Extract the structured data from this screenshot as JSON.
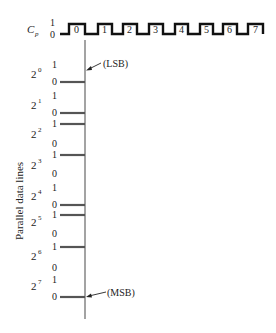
{
  "diagram": {
    "type": "timing-diagram",
    "clock": {
      "label": "C",
      "label_subscript": "p",
      "level_high": "1",
      "level_low": "0",
      "pulse_labels": [
        "0",
        "1",
        "2",
        "3",
        "4",
        "5",
        "6",
        "7"
      ],
      "pulse_rise_x": [
        69,
        98,
        123,
        149,
        175,
        200,
        223,
        248
      ],
      "pulse_fall_x": [
        85,
        112,
        137,
        163,
        188,
        213,
        237,
        263
      ],
      "color": "#111111"
    },
    "axis_label": "Parallel data lines",
    "lsb_label": "(LSB)",
    "msb_label": "(MSB)",
    "bit_lines": [
      {
        "base": "2",
        "exp": "0",
        "value": 0
      },
      {
        "base": "2",
        "exp": "1",
        "value": 0
      },
      {
        "base": "2",
        "exp": "2",
        "value": 1
      },
      {
        "base": "2",
        "exp": "3",
        "value": 1
      },
      {
        "base": "2",
        "exp": "4",
        "value": 0
      },
      {
        "base": "2",
        "exp": "5",
        "value": 1
      },
      {
        "base": "2",
        "exp": "6",
        "value": 1
      },
      {
        "base": "2",
        "exp": "7",
        "value": 0
      }
    ],
    "level_high": "1",
    "level_low": "0",
    "bar_color": "#555555",
    "line_color": "#666666"
  }
}
